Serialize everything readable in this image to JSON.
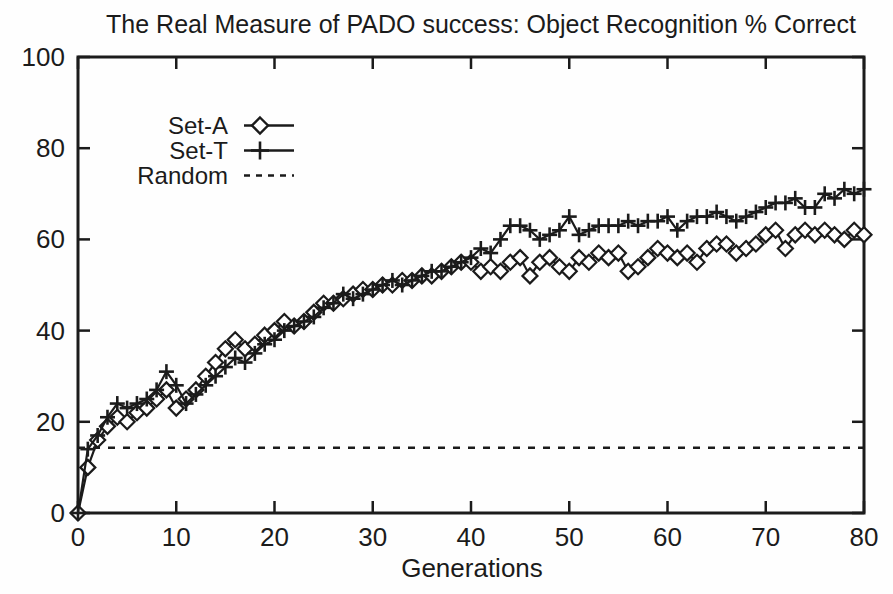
{
  "title": "The Real Measure of PADO success: Object Recognition % Correct",
  "colors": {
    "foreground": "#1b1b1b",
    "background": "#ffffff"
  },
  "chart_data": {
    "type": "line",
    "title": "The Real Measure of PADO success: Object Recognition % Correct",
    "xlabel": "Generations",
    "ylabel": "",
    "xlim": [
      0,
      80
    ],
    "ylim": [
      0,
      100
    ],
    "x_ticks": [
      0,
      10,
      20,
      30,
      40,
      50,
      60,
      70,
      80
    ],
    "y_ticks": [
      0,
      20,
      40,
      60,
      80,
      100
    ],
    "grid": false,
    "legend_position": "inside-top-left",
    "x_step": 1,
    "series": [
      {
        "name": "Set-A",
        "marker": "diamond",
        "line_style": "solid",
        "values": [
          0,
          10,
          16,
          19,
          21,
          20,
          22,
          23,
          25,
          27,
          23,
          25,
          27,
          30,
          33,
          36,
          38,
          36,
          37,
          39,
          40,
          42,
          41,
          42,
          44,
          46,
          46,
          47,
          48,
          49,
          49,
          50,
          50,
          51,
          51,
          52,
          52,
          53,
          54,
          55,
          55,
          53,
          54,
          53,
          55,
          56,
          52,
          55,
          56,
          54,
          53,
          56,
          55,
          57,
          56,
          57,
          53,
          54,
          56,
          58,
          57,
          56,
          57,
          55,
          58,
          59,
          59,
          57,
          58,
          59,
          61,
          62,
          58,
          61,
          62,
          61,
          62,
          61,
          60,
          62,
          61
        ]
      },
      {
        "name": "Set-T",
        "marker": "plus",
        "line_style": "solid",
        "values": [
          0,
          14,
          17,
          21,
          24,
          23,
          24,
          25,
          27,
          31,
          28,
          24,
          26,
          28,
          30,
          32,
          34,
          33,
          35,
          37,
          38,
          40,
          41,
          42,
          43,
          45,
          46,
          48,
          47,
          48,
          49,
          50,
          51,
          50,
          51,
          52,
          53,
          53,
          54,
          55,
          56,
          58,
          57,
          60,
          63,
          63,
          62,
          60,
          61,
          62,
          65,
          61,
          62,
          63,
          63,
          63,
          64,
          63,
          64,
          64,
          65,
          62,
          64,
          65,
          65,
          66,
          65,
          64,
          65,
          66,
          67,
          68,
          68,
          69,
          67,
          67,
          70,
          69,
          71,
          70,
          71
        ]
      },
      {
        "name": "Random",
        "marker": "none",
        "line_style": "dashed",
        "constant": 14.3
      }
    ]
  }
}
